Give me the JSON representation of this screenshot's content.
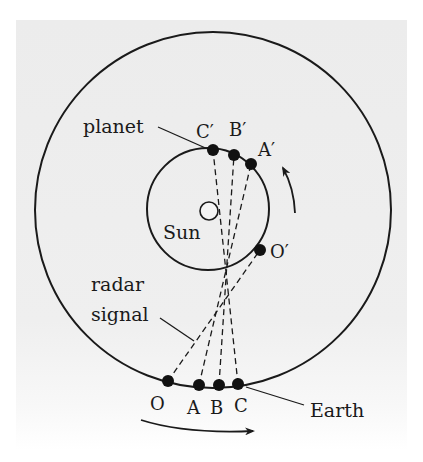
{
  "diagram": {
    "type": "radar-ranging-orbit-diagram",
    "labels": {
      "planet": "planet",
      "sun": "Sun",
      "radar_line1": "radar",
      "radar_line2": "signal",
      "earth": "Earth"
    },
    "planet_points": [
      {
        "id": "C_prime",
        "label": "C′"
      },
      {
        "id": "B_prime",
        "label": "B′"
      },
      {
        "id": "A_prime",
        "label": "A′"
      },
      {
        "id": "O_prime",
        "label": "O′"
      }
    ],
    "earth_points": [
      {
        "id": "O",
        "label": "O"
      },
      {
        "id": "A",
        "label": "A"
      },
      {
        "id": "B",
        "label": "B"
      },
      {
        "id": "C",
        "label": "C"
      }
    ],
    "arrows": {
      "planet_orbit_direction": "counterclockwise",
      "earth_orbit_direction": "counterclockwise"
    },
    "colors": {
      "ink": "#1a1a1a",
      "panel": "#ececec",
      "background": "#ffffff"
    }
  }
}
